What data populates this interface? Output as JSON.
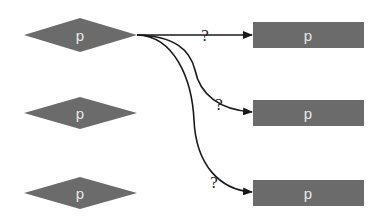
{
  "diagram": {
    "colors": {
      "node_fill": "#6b6b6b",
      "node_label": "#e8e8e8",
      "edge": "#1a1a1a",
      "background": "#ffffff"
    },
    "source_nodes": [
      {
        "shape": "diamond",
        "label": "p"
      },
      {
        "shape": "diamond",
        "label": "p"
      },
      {
        "shape": "diamond",
        "label": "p"
      }
    ],
    "target_nodes": [
      {
        "shape": "rectangle",
        "label": "p"
      },
      {
        "shape": "rectangle",
        "label": "p"
      },
      {
        "shape": "rectangle",
        "label": "p"
      }
    ],
    "edges": [
      {
        "from": "source_nodes.0",
        "to": "target_nodes.0",
        "label": "?"
      },
      {
        "from": "source_nodes.0",
        "to": "target_nodes.1",
        "label": "?"
      },
      {
        "from": "source_nodes.0",
        "to": "target_nodes.2",
        "label": "?"
      }
    ]
  }
}
